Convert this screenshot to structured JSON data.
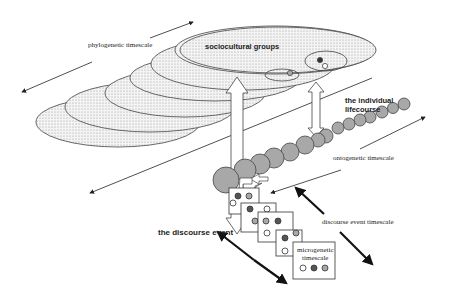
{
  "labels": {
    "phylogenetic": "phylogenetic timescale",
    "sociocultural": "sociocultural groups",
    "individual_line1": "the individual",
    "individual_line2": "lifecourse",
    "ontogenetic": "ontogenetic timescale",
    "discourse_event_timescale": "discourse event timescale",
    "discourse_event": "the discourse event",
    "microgenetic_line1": "microgenetic",
    "microgenetic_line2": "timescale"
  },
  "colors": {
    "stipple_fill": "#e6e6e6",
    "circle_fill": "#a8a8a8",
    "dark_dot": "#555555",
    "grey_dot": "#a8a8a8",
    "stroke": "#333333"
  }
}
